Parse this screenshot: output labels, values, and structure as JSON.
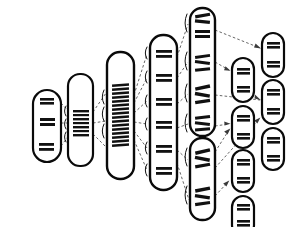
{
  "figure": {
    "title": "Hierarchical chromosome ideogram branching diagram",
    "background_color": "#ffffff",
    "stroke_color": "#0a0a0a",
    "band_color": "#111111",
    "link_color": "#4a4a4a",
    "width": 290,
    "height": 227
  },
  "chart_data": {
    "type": "diagram",
    "title": "Hierarchical chromosome ideogram branching diagram",
    "xlabel": "",
    "ylabel": "",
    "columns": [
      {
        "index": 0,
        "label": "column-1",
        "chromosome_count": 1
      },
      {
        "index": 1,
        "label": "column-2",
        "chromosome_count": 1
      },
      {
        "index": 2,
        "label": "column-3",
        "chromosome_count": 1
      },
      {
        "index": 3,
        "label": "column-4",
        "chromosome_count": 1
      },
      {
        "index": 4,
        "label": "column-5",
        "chromosome_count": 2
      },
      {
        "index": 5,
        "label": "column-6",
        "chromosome_count": 4
      },
      {
        "index": 6,
        "label": "column-7",
        "chromosome_count": 4
      }
    ],
    "nodes": [
      {
        "id": "c1",
        "name": "chromosome-c1",
        "column": 0,
        "x": 33,
        "y": 90,
        "width": 28,
        "height": 72,
        "rx": 14,
        "band_groups": 3,
        "band_style": "wide-triple",
        "braces": 0
      },
      {
        "id": "c2",
        "name": "chromosome-c2",
        "column": 1,
        "x": 68,
        "y": 74,
        "width": 25,
        "height": 92,
        "rx": 12,
        "band_groups": 1,
        "band_style": "dense-stack",
        "braces": 3
      },
      {
        "id": "c3",
        "name": "chromosome-c3",
        "column": 2,
        "x": 107,
        "y": 52,
        "width": 27,
        "height": 127,
        "rx": 13,
        "band_groups": 1,
        "band_style": "dense-slanted",
        "braces": 3
      },
      {
        "id": "c4",
        "name": "chromosome-c4",
        "column": 3,
        "x": 150,
        "y": 35,
        "width": 27,
        "height": 155,
        "rx": 13,
        "band_groups": 6,
        "band_style": "wide-double",
        "braces": 6
      },
      {
        "id": "c5a",
        "name": "chromosome-c5a",
        "column": 4,
        "x": 190,
        "y": 8,
        "width": 25,
        "height": 128,
        "rx": 12,
        "band_groups": 4,
        "band_style": "mixed-slanted",
        "braces": 4
      },
      {
        "id": "c5b",
        "name": "chromosome-c5b",
        "column": 4,
        "x": 190,
        "y": 138,
        "width": 25,
        "height": 82,
        "rx": 12,
        "band_groups": 2,
        "band_style": "mixed-slanted",
        "braces": 2
      },
      {
        "id": "c6a",
        "name": "chromosome-c6a",
        "column": 5,
        "x": 232,
        "y": 58,
        "width": 22,
        "height": 44,
        "rx": 11,
        "band_groups": 2,
        "band_style": "wide-double",
        "braces": 0
      },
      {
        "id": "c6b",
        "name": "chromosome-c6b",
        "column": 5,
        "x": 232,
        "y": 106,
        "width": 22,
        "height": 42,
        "rx": 11,
        "band_groups": 2,
        "band_style": "wide-double",
        "braces": 0
      },
      {
        "id": "c6c",
        "name": "chromosome-c6c",
        "column": 5,
        "x": 232,
        "y": 150,
        "width": 22,
        "height": 42,
        "rx": 11,
        "band_groups": 2,
        "band_style": "wide-double",
        "braces": 0
      },
      {
        "id": "c6d",
        "name": "chromosome-c6d",
        "column": 5,
        "x": 232,
        "y": 196,
        "width": 22,
        "height": 40,
        "rx": 11,
        "band_groups": 2,
        "band_style": "wide-double",
        "braces": 0
      },
      {
        "id": "c7a",
        "name": "chromosome-c7a",
        "column": 6,
        "x": 262,
        "y": 33,
        "width": 22,
        "height": 44,
        "rx": 11,
        "band_groups": 2,
        "band_style": "wide-double",
        "braces": 0
      },
      {
        "id": "c7b",
        "name": "chromosome-c7b",
        "column": 6,
        "x": 262,
        "y": 80,
        "width": 22,
        "height": 44,
        "rx": 11,
        "band_groups": 2,
        "band_style": "wide-double",
        "braces": 0
      },
      {
        "id": "c7c",
        "name": "chromosome-c7c",
        "column": 6,
        "x": 262,
        "y": 128,
        "width": 22,
        "height": 42,
        "rx": 11,
        "band_groups": 2,
        "band_style": "wide-double",
        "braces": 0
      },
      {
        "id": "c7d",
        "name": "chromosome-c7d",
        "column": 6,
        "x": 262,
        "y": 130,
        "width": 22,
        "height": 42,
        "rx": 11,
        "band_groups": 2,
        "band_style": "wide-double",
        "braces": 0
      }
    ],
    "edges": [
      {
        "from": "c1",
        "to": "c2",
        "style": "dashed",
        "arrow": false
      },
      {
        "from": "c1",
        "to": "c2",
        "style": "dashed",
        "arrow": false
      },
      {
        "from": "c1",
        "to": "c2",
        "style": "dashed",
        "arrow": false
      },
      {
        "from": "c2",
        "to": "c3",
        "style": "dashed",
        "arrow": false
      },
      {
        "from": "c2",
        "to": "c3",
        "style": "dashed",
        "arrow": false
      },
      {
        "from": "c2",
        "to": "c3",
        "style": "dashed",
        "arrow": false
      },
      {
        "from": "c3",
        "to": "c4",
        "style": "dashed",
        "arrow": false
      },
      {
        "from": "c4",
        "to": "c5a",
        "style": "dashed",
        "arrow": false
      },
      {
        "from": "c4",
        "to": "c5b",
        "style": "dashed",
        "arrow": false
      },
      {
        "from": "c5a",
        "to": "c7a",
        "style": "dashed",
        "arrow": true
      },
      {
        "from": "c5a",
        "to": "c6a",
        "style": "dashed",
        "arrow": true
      },
      {
        "from": "c5a",
        "to": "c7b",
        "style": "dashed",
        "arrow": true
      },
      {
        "from": "c5a",
        "to": "c6b",
        "style": "dashed",
        "arrow": true
      },
      {
        "from": "c5b",
        "to": "c6c",
        "style": "dashed",
        "arrow": true
      },
      {
        "from": "c5b",
        "to": "c6d",
        "style": "dashed",
        "arrow": true
      },
      {
        "from": "c5b",
        "to": "c7c",
        "style": "dashed",
        "arrow": true
      }
    ]
  }
}
